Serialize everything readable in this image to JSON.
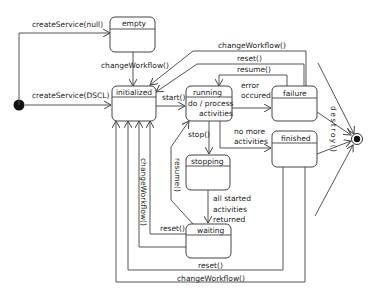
{
  "diagram": {
    "type": "UML state machine",
    "initial_state": {
      "label": ""
    },
    "final_state": {
      "label": ""
    },
    "states": [
      {
        "id": "empty",
        "label": "empty"
      },
      {
        "id": "initialized",
        "label": "initialized"
      },
      {
        "id": "running",
        "label": "running",
        "activity_line1": "do / process",
        "activity_line2": "activities"
      },
      {
        "id": "failure",
        "label": "failure"
      },
      {
        "id": "finished",
        "label": "finished"
      },
      {
        "id": "stopping",
        "label": "stopping"
      },
      {
        "id": "waiting",
        "label": "waiting"
      }
    ],
    "transitions": {
      "create_null": "createService(null)",
      "create_dscl": "createService(DSCL)",
      "empty_change": "changeWorkflow()",
      "start": "start()",
      "error_line1": "error",
      "error_line2": "occured",
      "no_more_line1": "no more",
      "no_more_line2": "activities",
      "stop": "stop()",
      "resume_failure": "resume()",
      "resume_waiting": "resume()",
      "reset_failure": "reset()",
      "change_failure": "changeWorkflow()",
      "all_started_line1": "all started",
      "all_started_line2": "activities",
      "all_started_line3": "returned",
      "reset_waiting": "reset()",
      "change_waiting": "changeWorkflow()",
      "reset_finished": "reset()",
      "change_finished": "changeWorkflow()",
      "destroy": "destroy()"
    }
  }
}
